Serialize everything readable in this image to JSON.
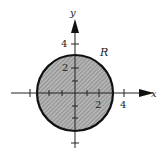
{
  "diagram": {
    "type": "region-plot",
    "region_label": "R",
    "x_axis_label": "x",
    "y_axis_label": "y",
    "x_tick_labels": [
      "2",
      "4"
    ],
    "y_tick_labels": [
      "2",
      "4"
    ],
    "circle": {
      "center": [
        0,
        0
      ],
      "radius": 3
    },
    "colors": {
      "fill": "#a8a8a8",
      "stroke": "#111111",
      "axis": "#222222"
    }
  }
}
